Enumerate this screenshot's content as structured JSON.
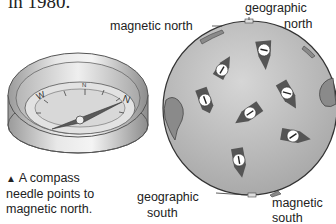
{
  "top_text": "in 1980.",
  "compass": {
    "dial_letters": [
      "W",
      "N",
      "N"
    ],
    "caption_marker": "▲",
    "caption_lines": [
      "A compass",
      "needle points to",
      "magnetic north."
    ]
  },
  "globe": {
    "labels": {
      "magnetic_north": "magnetic north",
      "geographic_north_1": "geographic",
      "geographic_north_2": "north",
      "geographic_south_1": "geographic",
      "geographic_south_2": "south",
      "magnetic_south_1": "magnetic",
      "magnetic_south_2": "south"
    },
    "needle_count": 7
  },
  "colors": {
    "globe_fill": "#b9b9b9",
    "land_fill": "#8a8a8a",
    "needle_dark": "#555555",
    "compass_metal": "#c8c8c8"
  }
}
